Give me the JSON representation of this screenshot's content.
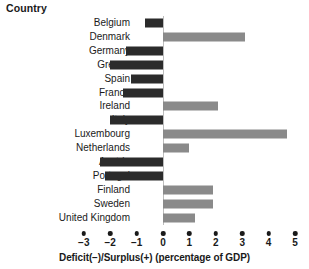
{
  "chart_data": {
    "type": "bar",
    "orientation": "horizontal",
    "title": "",
    "category_axis_title": "Country",
    "xlabel": "Deficit(−)/Surplus(+) (percentage of GDP)",
    "ylabel": "Country",
    "categories": [
      "Belgium",
      "Denmark",
      "Germany",
      "Greece",
      "Spain",
      "France",
      "Ireland",
      "Italy",
      "Luxembourg",
      "Netherlands",
      "Austria",
      "Portugal",
      "Finland",
      "Sweden",
      "United Kingdom"
    ],
    "values": [
      -0.7,
      3.1,
      -1.4,
      -2.0,
      -1.2,
      -1.5,
      2.1,
      -2.0,
      4.7,
      1.0,
      -2.4,
      -2.2,
      1.9,
      1.9,
      1.2
    ],
    "xlim": [
      -3,
      5
    ],
    "xticks": [
      -3,
      -2,
      -1,
      0,
      1,
      2,
      3,
      4,
      5
    ],
    "xtick_labels": [
      "−3",
      "−2",
      "−1",
      "0",
      "1",
      "2",
      "3",
      "4",
      "5"
    ],
    "grid": false,
    "legend": "none",
    "colors": {
      "negative_bar": "#2b2b2b",
      "positive_bar": "#8a8a8a",
      "zero_line": "#bdbdbd",
      "text": "#1a1a1a",
      "background": "#ffffff"
    }
  }
}
